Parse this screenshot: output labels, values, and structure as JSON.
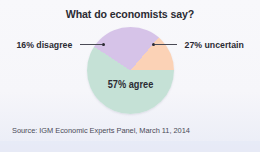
{
  "figure": {
    "title": "What do economists say?",
    "source": "Source: IGM Economic Experts Panel, March 11, 2014",
    "background_color": "#f6f6fa",
    "text_color": "#2b2b33"
  },
  "callouts": {
    "left": {
      "label": "16% disagree",
      "icon": "leader-line-dot"
    },
    "right": {
      "label": "27% uncertain",
      "icon": "leader-line-dot"
    }
  },
  "inner_label": "57% agree",
  "chart_data": {
    "type": "pie",
    "title": "What do economists say?",
    "subtitle": "",
    "xlabel": "",
    "ylabel": "",
    "categories": [
      "agree",
      "uncertain",
      "disagree"
    ],
    "values": [
      57,
      27,
      16
    ],
    "value_unit": "%",
    "labels": [
      "57% agree",
      "27% uncertain",
      "16% disagree"
    ],
    "colors": [
      "#c5e1d6",
      "#d6c3e8",
      "#fbd2b6"
    ],
    "legend": "none",
    "grid": false,
    "start_angle_deg": 0,
    "direction": "clockwise",
    "annotations": [
      "16% disagree",
      "27% uncertain",
      "57% agree"
    ],
    "source": "Source: IGM Economic Experts Panel, March 11, 2014"
  }
}
